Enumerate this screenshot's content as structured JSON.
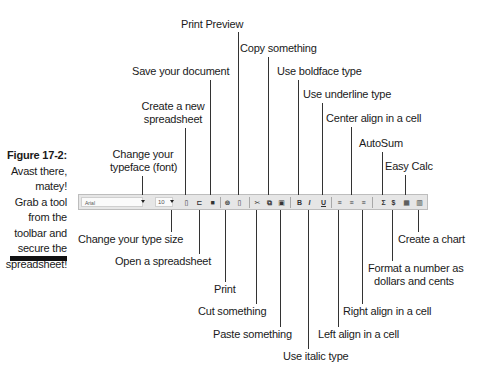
{
  "caption": {
    "figure": "Figure 17-2:",
    "lines": [
      "Avast there,",
      "matey!",
      "Grab a tool",
      "from the",
      "toolbar and",
      "secure the",
      "spreadsheet!"
    ]
  },
  "toolbar": {
    "font_name": "Arial",
    "font_size": "10",
    "icons": [
      {
        "name": "new-icon",
        "glyph": "▯"
      },
      {
        "name": "open-icon",
        "glyph": "⊏"
      },
      {
        "name": "save-icon",
        "glyph": "■"
      },
      {
        "name": "print-icon",
        "glyph": "⊚"
      },
      {
        "name": "print-preview-icon",
        "glyph": "▯"
      },
      {
        "name": "cut-icon",
        "glyph": "✂"
      },
      {
        "name": "copy-icon",
        "glyph": "⧉"
      },
      {
        "name": "paste-icon",
        "glyph": "▣"
      },
      {
        "name": "bold-icon",
        "glyph": "B"
      },
      {
        "name": "italic-icon",
        "glyph": "I"
      },
      {
        "name": "underline-icon",
        "glyph": "U"
      },
      {
        "name": "align-left-icon",
        "glyph": "≡"
      },
      {
        "name": "align-center-icon",
        "glyph": "≡"
      },
      {
        "name": "align-right-icon",
        "glyph": "≡"
      },
      {
        "name": "autosum-icon",
        "glyph": "Σ"
      },
      {
        "name": "currency-icon",
        "glyph": "$"
      },
      {
        "name": "easy-calc-icon",
        "glyph": "▦"
      },
      {
        "name": "chart-icon",
        "glyph": "▥"
      }
    ]
  },
  "labels": {
    "print_preview": "Print Preview",
    "copy_something": "Copy something",
    "save_document": "Save your document",
    "use_boldface": "Use boldface type",
    "use_underline": "Use underline type",
    "create_new_1": "Create a new",
    "create_new_2": "spreadsheet",
    "center_align": "Center align in a cell",
    "change_typeface_1": "Change your",
    "change_typeface_2": "typeface (font)",
    "autosum": "AutoSum",
    "easy_calc": "Easy Calc",
    "change_size": "Change your type size",
    "open_spreadsheet": "Open a spreadsheet",
    "print": "Print",
    "cut_something": "Cut something",
    "paste_something": "Paste something",
    "use_italic": "Use italic type",
    "left_align": "Left align in a cell",
    "right_align": "Right align in a cell",
    "format_currency_1": "Format a number as",
    "format_currency_2": "dollars and cents",
    "create_chart": "Create a chart"
  }
}
